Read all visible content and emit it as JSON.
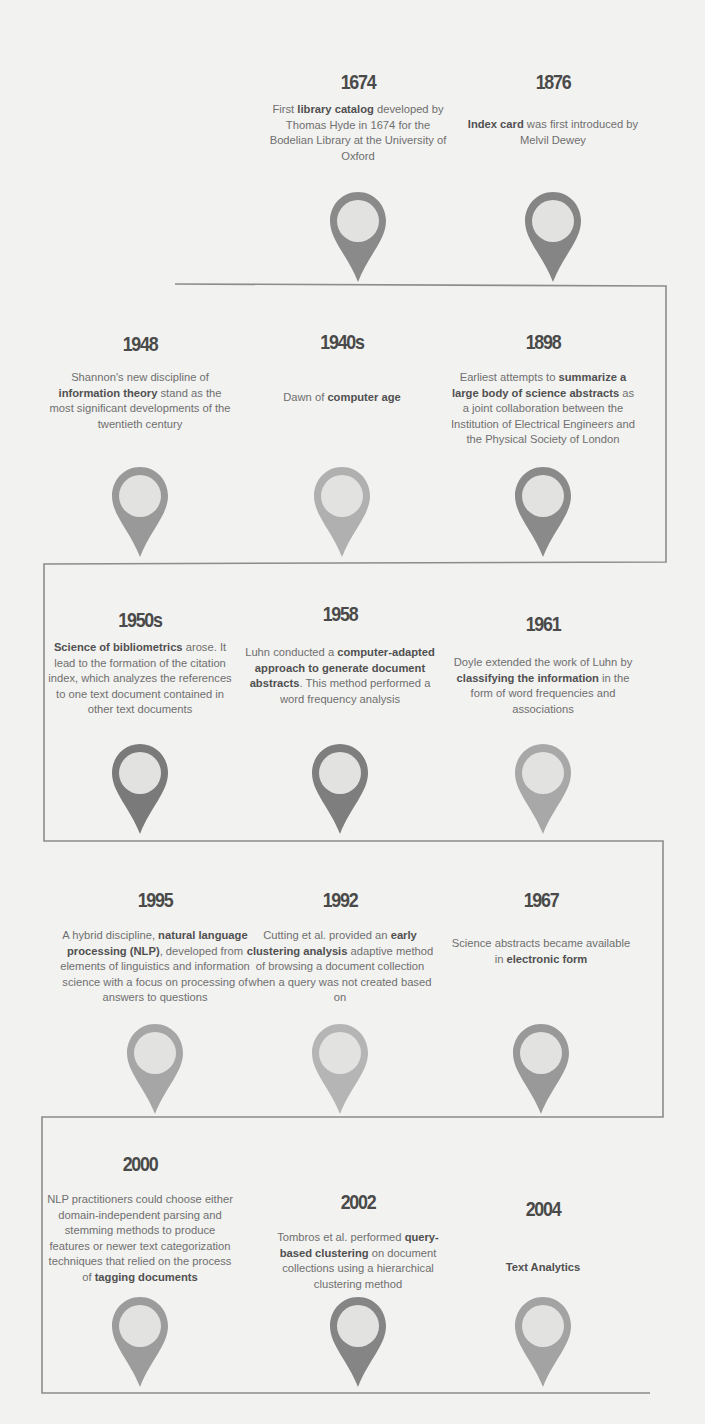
{
  "title_fragment": "...gy ... g...",
  "events": [
    {
      "year": "1674",
      "pre": "First ",
      "bold": "library catalog",
      "post": " developed by Thomas Hyde in 1674 for the Bodelian Library at the University of Oxford",
      "shade": "#8a8a8a"
    },
    {
      "year": "1876",
      "pre": "",
      "bold": "Index card",
      "post": " was first introduced by Melvil Dewey",
      "shade": "#858585"
    },
    {
      "year": "1898",
      "pre": "Earliest attempts to ",
      "bold": "summarize a large body of science abstracts",
      "post": " as a joint collaboration between the Institution of Electrical Engineers and the Physical Society of London",
      "shade": "#8a8a8a"
    },
    {
      "year": "1940s",
      "pre": "Dawn of ",
      "bold": "computer age",
      "post": "",
      "shade": "#b0b0b0"
    },
    {
      "year": "1948",
      "pre": "Shannon's new discipline of ",
      "bold": "information theory",
      "post": " stand as the most significant developments of the twentieth century",
      "shade": "#999999"
    },
    {
      "year": "1950s",
      "pre": "",
      "bold": "Science of bibliometrics",
      "post": " arose. It lead to the formation of the citation index, which analyzes the references to one text document contained in other text documents",
      "shade": "#7a7a7a"
    },
    {
      "year": "1958",
      "pre": "Luhn conducted a ",
      "bold": "computer-adapted approach to generate document abstracts",
      "post": ". This method performed a word frequency analysis",
      "shade": "#7e7e7e"
    },
    {
      "year": "1961",
      "pre": "Doyle extended the work of Luhn by ",
      "bold": "classifying the information",
      "post": " in the form of word frequencies and associations",
      "shade": "#a8a8a8"
    },
    {
      "year": "1967",
      "pre": "Science abstracts became available in ",
      "bold": "electronic form",
      "post": "",
      "shade": "#999999"
    },
    {
      "year": "1992",
      "pre": "Cutting et al. provided an ",
      "bold": "early clustering analysis",
      "post": " adaptive method of browsing a document collection when a query was not created based on",
      "shade": "#b5b5b5"
    },
    {
      "year": "1995",
      "pre": "A hybrid discipline, ",
      "bold": "natural language processing (NLP)",
      "post": ", developed from elements of linguistics and information science with a focus on processing of answers to questions",
      "shade": "#a6a6a6"
    },
    {
      "year": "2000",
      "pre": "NLP practitioners could choose either domain-independent parsing and stemming methods to produce features or newer text categorization techniques that relied on the process of ",
      "bold": "tagging documents",
      "post": "",
      "shade": "#9c9c9c"
    },
    {
      "year": "2002",
      "pre": "Tombros et al. performed ",
      "bold": "query-based clustering",
      "post": " on document collections using a hierarchical clustering method",
      "shade": "#858585"
    },
    {
      "year": "2004",
      "pre": "",
      "bold": "Text Analytics",
      "post": "",
      "shade": "#a3a3a3"
    }
  ]
}
